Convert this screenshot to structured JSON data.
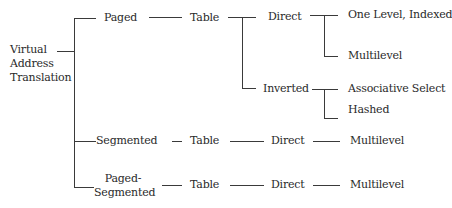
{
  "diagram": {
    "type": "tree",
    "root": {
      "lines": [
        "Virtual",
        "Address",
        "Translation"
      ]
    },
    "branches": {
      "paged": {
        "label": "Paged",
        "table": "Table",
        "direct": {
          "label": "Direct",
          "children": [
            "One Level, Indexed",
            "Multilevel"
          ]
        },
        "inverted": {
          "label": "Inverted",
          "children": [
            "Associative Select",
            "Hashed"
          ]
        }
      },
      "segmented": {
        "label": "Segmented",
        "table": "Table",
        "direct": "Direct",
        "leaf": "Multilevel"
      },
      "paged_segmented": {
        "lines": [
          "Paged-",
          "Segmented"
        ],
        "table": "Table",
        "direct": "Direct",
        "leaf": "Multilevel"
      }
    },
    "colors": {
      "line": "#3a3a3a",
      "text": "#2a2a2a",
      "background": "#ffffff"
    }
  }
}
